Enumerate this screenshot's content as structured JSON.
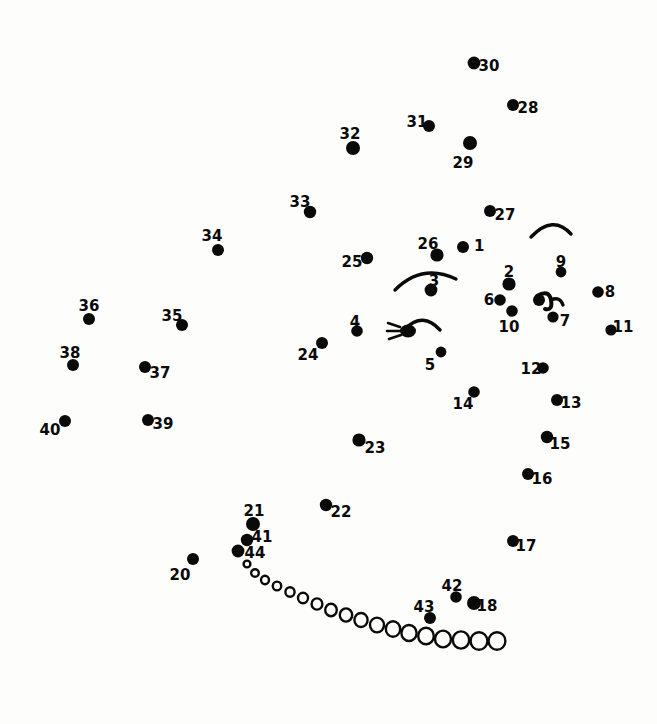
{
  "page": {
    "kind": "dot-to-dot-puzzle",
    "background_color": "#fdfdfc",
    "ink_color": "#0a0a0a",
    "width": 657,
    "height": 724
  },
  "puzzle": {
    "dot_count": 44,
    "numbered_dots": [
      {
        "n": "1",
        "label": "1",
        "x": 463,
        "y": 247,
        "r": 6.0,
        "lx": 474,
        "ly": 246,
        "anchor": "start"
      },
      {
        "n": "2",
        "label": "2",
        "x": 509,
        "y": 284,
        "r": 6.6,
        "lx": 509,
        "ly": 272,
        "anchor": "middle"
      },
      {
        "n": "3",
        "label": "3",
        "x": 431,
        "y": 290,
        "r": 6.4,
        "lx": 434,
        "ly": 281,
        "anchor": "middle"
      },
      {
        "n": "4",
        "label": "4",
        "x": 357,
        "y": 331,
        "r": 5.8,
        "lx": 355,
        "ly": 322,
        "anchor": "middle"
      },
      {
        "n": "5",
        "label": "5",
        "x": 441,
        "y": 352,
        "r": 5.4,
        "lx": 430,
        "ly": 365,
        "anchor": "middle"
      },
      {
        "n": "6",
        "label": "6",
        "x": 500,
        "y": 300,
        "r": 5.8,
        "lx": 489,
        "ly": 300,
        "anchor": "middle"
      },
      {
        "n": "7",
        "label": "7",
        "x": 553,
        "y": 317,
        "r": 5.6,
        "lx": 565,
        "ly": 321,
        "anchor": "middle"
      },
      {
        "n": "8",
        "label": "8",
        "x": 598,
        "y": 292,
        "r": 5.8,
        "lx": 610,
        "ly": 292,
        "anchor": "middle"
      },
      {
        "n": "9",
        "label": "9",
        "x": 561,
        "y": 272,
        "r": 5.4,
        "lx": 561,
        "ly": 262,
        "anchor": "middle"
      },
      {
        "n": "10",
        "label": "10",
        "x": 512,
        "y": 311,
        "r": 5.8,
        "lx": 509,
        "ly": 327,
        "anchor": "middle"
      },
      {
        "n": "11",
        "label": "11",
        "x": 611,
        "y": 330,
        "r": 5.6,
        "lx": 623,
        "ly": 327,
        "anchor": "middle"
      },
      {
        "n": "12",
        "label": "12",
        "x": 543,
        "y": 368,
        "r": 5.8,
        "lx": 531,
        "ly": 369,
        "anchor": "middle"
      },
      {
        "n": "13",
        "label": "13",
        "x": 557,
        "y": 400,
        "r": 6.0,
        "lx": 571,
        "ly": 403,
        "anchor": "middle"
      },
      {
        "n": "14",
        "label": "14",
        "x": 474,
        "y": 392,
        "r": 5.8,
        "lx": 463,
        "ly": 404,
        "anchor": "middle"
      },
      {
        "n": "15",
        "label": "15",
        "x": 547,
        "y": 437,
        "r": 6.2,
        "lx": 560,
        "ly": 444,
        "anchor": "middle"
      },
      {
        "n": "16",
        "label": "16",
        "x": 528,
        "y": 474,
        "r": 6.0,
        "lx": 542,
        "ly": 479,
        "anchor": "middle"
      },
      {
        "n": "17",
        "label": "17",
        "x": 513,
        "y": 541,
        "r": 6.0,
        "lx": 526,
        "ly": 546,
        "anchor": "middle"
      },
      {
        "n": "18",
        "label": "18",
        "x": 474,
        "y": 603,
        "r": 7.0,
        "lx": 487,
        "ly": 606,
        "anchor": "middle"
      },
      {
        "n": "20",
        "label": "20",
        "x": 193,
        "y": 559,
        "r": 6.0,
        "lx": 180,
        "ly": 575,
        "anchor": "middle"
      },
      {
        "n": "21",
        "label": "21",
        "x": 253,
        "y": 524,
        "r": 7.0,
        "lx": 254,
        "ly": 511,
        "anchor": "middle"
      },
      {
        "n": "22",
        "label": "22",
        "x": 326,
        "y": 505,
        "r": 6.2,
        "lx": 341,
        "ly": 512,
        "anchor": "middle"
      },
      {
        "n": "23",
        "label": "23",
        "x": 359,
        "y": 440,
        "r": 6.6,
        "lx": 375,
        "ly": 448,
        "anchor": "middle"
      },
      {
        "n": "24",
        "label": "24",
        "x": 322,
        "y": 343,
        "r": 6.0,
        "lx": 308,
        "ly": 355,
        "anchor": "middle"
      },
      {
        "n": "25",
        "label": "25",
        "x": 367,
        "y": 258,
        "r": 6.2,
        "lx": 352,
        "ly": 262,
        "anchor": "middle"
      },
      {
        "n": "26",
        "label": "26",
        "x": 437,
        "y": 255,
        "r": 6.6,
        "lx": 428,
        "ly": 244,
        "anchor": "middle"
      },
      {
        "n": "27",
        "label": "27",
        "x": 490,
        "y": 211,
        "r": 6.0,
        "lx": 505,
        "ly": 215,
        "anchor": "middle"
      },
      {
        "n": "28",
        "label": "28",
        "x": 513,
        "y": 105,
        "r": 6.0,
        "lx": 528,
        "ly": 108,
        "anchor": "middle"
      },
      {
        "n": "29",
        "label": "29",
        "x": 470,
        "y": 143,
        "r": 7.0,
        "lx": 463,
        "ly": 163,
        "anchor": "middle"
      },
      {
        "n": "30",
        "label": "30",
        "x": 474,
        "y": 63,
        "r": 6.4,
        "lx": 489,
        "ly": 66,
        "anchor": "middle"
      },
      {
        "n": "31",
        "label": "31",
        "x": 429,
        "y": 126,
        "r": 6.0,
        "lx": 417,
        "ly": 122,
        "anchor": "middle"
      },
      {
        "n": "32",
        "label": "32",
        "x": 353,
        "y": 148,
        "r": 7.0,
        "lx": 350,
        "ly": 134,
        "anchor": "middle"
      },
      {
        "n": "33",
        "label": "33",
        "x": 310,
        "y": 212,
        "r": 6.2,
        "lx": 300,
        "ly": 202,
        "anchor": "middle"
      },
      {
        "n": "34",
        "label": "34",
        "x": 218,
        "y": 250,
        "r": 6.0,
        "lx": 212,
        "ly": 236,
        "anchor": "middle"
      },
      {
        "n": "35",
        "label": "35",
        "x": 182,
        "y": 325,
        "r": 6.0,
        "lx": 172,
        "ly": 316,
        "anchor": "middle"
      },
      {
        "n": "36",
        "label": "36",
        "x": 89,
        "y": 319,
        "r": 6.0,
        "lx": 89,
        "ly": 306,
        "anchor": "middle"
      },
      {
        "n": "37",
        "label": "37",
        "x": 145,
        "y": 367,
        "r": 6.0,
        "lx": 160,
        "ly": 373,
        "anchor": "middle"
      },
      {
        "n": "38",
        "label": "38",
        "x": 73,
        "y": 365,
        "r": 6.0,
        "lx": 70,
        "ly": 353,
        "anchor": "middle"
      },
      {
        "n": "39",
        "label": "39",
        "x": 148,
        "y": 420,
        "r": 6.0,
        "lx": 163,
        "ly": 424,
        "anchor": "middle"
      },
      {
        "n": "40",
        "label": "40",
        "x": 65,
        "y": 421,
        "r": 6.0,
        "lx": 50,
        "ly": 430,
        "anchor": "middle"
      },
      {
        "n": "41",
        "label": "41",
        "x": 247,
        "y": 540,
        "r": 6.2,
        "lx": 262,
        "ly": 537,
        "anchor": "middle"
      },
      {
        "n": "42",
        "label": "42",
        "x": 456,
        "y": 597,
        "r": 5.8,
        "lx": 452,
        "ly": 586,
        "anchor": "middle"
      },
      {
        "n": "43",
        "label": "43",
        "x": 430,
        "y": 618,
        "r": 6.0,
        "lx": 424,
        "ly": 607,
        "anchor": "middle"
      },
      {
        "n": "44",
        "label": "44",
        "x": 238,
        "y": 551,
        "r": 6.4,
        "lx": 255,
        "ly": 553,
        "anchor": "middle"
      }
    ],
    "hollow_circle_chain": {
      "description": "arc of progressively larger open ellipses forming a smile / bowl curve",
      "circles": [
        {
          "x": 247,
          "y": 564,
          "rx": 3.4,
          "ry": 3.4
        },
        {
          "x": 255,
          "y": 573,
          "rx": 3.8,
          "ry": 3.8
        },
        {
          "x": 265,
          "y": 580,
          "rx": 4.0,
          "ry": 4.2
        },
        {
          "x": 277,
          "y": 586,
          "rx": 4.2,
          "ry": 4.4
        },
        {
          "x": 290,
          "y": 592,
          "rx": 4.6,
          "ry": 4.8
        },
        {
          "x": 303,
          "y": 598,
          "rx": 5.0,
          "ry": 5.2
        },
        {
          "x": 317,
          "y": 604,
          "rx": 5.4,
          "ry": 5.6
        },
        {
          "x": 331,
          "y": 610,
          "rx": 5.8,
          "ry": 6.2
        },
        {
          "x": 346,
          "y": 615,
          "rx": 6.2,
          "ry": 6.6
        },
        {
          "x": 361,
          "y": 620,
          "rx": 6.6,
          "ry": 7.0
        },
        {
          "x": 377,
          "y": 625,
          "rx": 7.0,
          "ry": 7.4
        },
        {
          "x": 393,
          "y": 629,
          "rx": 7.2,
          "ry": 7.8
        },
        {
          "x": 409,
          "y": 633,
          "rx": 7.6,
          "ry": 8.0
        },
        {
          "x": 426,
          "y": 636,
          "rx": 7.8,
          "ry": 8.2
        },
        {
          "x": 443,
          "y": 639,
          "rx": 8.0,
          "ry": 8.4
        },
        {
          "x": 461,
          "y": 640,
          "rx": 8.2,
          "ry": 8.6
        },
        {
          "x": 479,
          "y": 641,
          "rx": 8.4,
          "ry": 8.8
        },
        {
          "x": 497,
          "y": 641,
          "rx": 8.4,
          "ry": 8.8
        }
      ]
    },
    "strokes": [
      {
        "name": "arc-above-dot-3",
        "d": "M 395 290 Q 422 263 456 279",
        "width": 3.4
      },
      {
        "name": "arc-upper-right",
        "d": "M 531 237 Q 553 214 571 234",
        "width": 3.4
      },
      {
        "name": "hook-glyph-above-dot-7",
        "d": "M 537 296 Q 549 289 551 300 Q 553 311 545 309",
        "width": 4.0
      },
      {
        "name": "hook-glyph-tail",
        "d": "M 551 300 Q 560 296 563 305",
        "width": 3.4
      },
      {
        "name": "spider-glyph-arc",
        "d": "M 405 329 Q 423 311 440 330",
        "width": 3.4
      },
      {
        "name": "spider-leg-1",
        "d": "M 400 327 L 388 323",
        "width": 2.6
      },
      {
        "name": "spider-leg-2",
        "d": "M 400 331 L 387 331",
        "width": 2.6
      },
      {
        "name": "spider-leg-3",
        "d": "M 401 335 L 389 339",
        "width": 2.6
      }
    ],
    "blobs": [
      {
        "name": "spider-body",
        "x": 408,
        "y": 331,
        "rx": 8.0,
        "ry": 6.4
      },
      {
        "name": "hook-glyph-head",
        "x": 539,
        "y": 300,
        "rx": 6.0,
        "ry": 6.0
      }
    ]
  }
}
